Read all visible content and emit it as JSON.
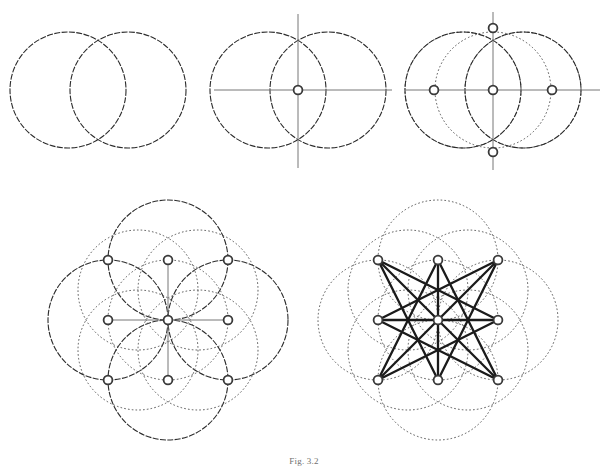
{
  "figure": {
    "caption": "Fig. 3.2",
    "panel_count": 5,
    "colors": {
      "background": "#ffffff",
      "solid_stroke": "#2b2b2b",
      "dotted_stroke": "#555555",
      "axis_stroke": "#777777",
      "node_stroke": "#3a3a3a",
      "node_fill": "#ffffff",
      "star_stroke": "#1a1a1a"
    },
    "stroke_widths": {
      "solid_circle": 1.1,
      "dotted_circle": 1.0,
      "axis": 1.0,
      "node_ring": 1.8,
      "star_chord": 2.3
    },
    "node_radius": 4.4,
    "panels": [
      {
        "id": "panel-1",
        "label": "Step 1 - Vesica piscis",
        "step_number": 1,
        "origin": [
          0,
          0
        ],
        "unit": 58,
        "circles": [
          {
            "cx": 68,
            "cy": 90,
            "r": 58,
            "style": "solid"
          },
          {
            "cx": 128,
            "cy": 90,
            "r": 58,
            "style": "solid"
          }
        ],
        "axes": [],
        "nodes": [],
        "chords": []
      },
      {
        "id": "panel-2",
        "label": "Step 2 - Axes through centre",
        "step_number": 2,
        "origin": [
          195,
          0
        ],
        "unit": 58,
        "circles": [
          {
            "cx": 268,
            "cy": 90,
            "r": 58,
            "style": "solid"
          },
          {
            "cx": 328,
            "cy": 90,
            "r": 58,
            "style": "solid"
          }
        ],
        "axes": [
          {
            "x1": 214,
            "y1": 90,
            "x2": 392,
            "y2": 90
          },
          {
            "x1": 298,
            "y1": 14,
            "x2": 298,
            "y2": 168
          }
        ],
        "nodes": [
          {
            "cx": 298,
            "cy": 90,
            "name": "centre"
          }
        ],
        "chords": []
      },
      {
        "id": "panel-3",
        "label": "Step 3 - Four cardinal points",
        "step_number": 3,
        "origin": [
          395,
          0
        ],
        "unit": 58,
        "circles": [
          {
            "cx": 463,
            "cy": 90,
            "r": 58,
            "style": "dotted"
          },
          {
            "cx": 523,
            "cy": 90,
            "r": 58,
            "style": "dotted"
          },
          {
            "cx": 493,
            "cy": 90,
            "r": 58,
            "style": "dotted"
          },
          {
            "cx": 463,
            "cy": 90,
            "r": 58,
            "style": "solid"
          },
          {
            "cx": 523,
            "cy": 90,
            "r": 58,
            "style": "solid"
          }
        ],
        "axes": [
          {
            "x1": 405,
            "y1": 90,
            "x2": 600,
            "y2": 90
          },
          {
            "x1": 493,
            "y1": 12,
            "x2": 493,
            "y2": 170
          }
        ],
        "nodes": [
          {
            "cx": 493,
            "cy": 90,
            "name": "centre"
          },
          {
            "cx": 434,
            "cy": 90,
            "name": "west"
          },
          {
            "cx": 552,
            "cy": 90,
            "name": "east"
          },
          {
            "cx": 493,
            "cy": 28,
            "name": "north"
          },
          {
            "cx": 493,
            "cy": 152,
            "name": "south"
          }
        ],
        "chords": []
      },
      {
        "id": "panel-4",
        "label": "Step 4 - Nine-point lattice",
        "step_number": 4,
        "origin": [
          40,
          195
        ],
        "unit": 60,
        "centre": [
          168,
          320
        ],
        "circles": [
          {
            "cx": 168,
            "cy": 260,
            "r": 60,
            "style": "solid"
          },
          {
            "cx": 168,
            "cy": 380,
            "r": 60,
            "style": "solid"
          },
          {
            "cx": 108,
            "cy": 320,
            "r": 60,
            "style": "solid"
          },
          {
            "cx": 228,
            "cy": 320,
            "r": 60,
            "style": "solid"
          },
          {
            "cx": 168,
            "cy": 320,
            "r": 60,
            "style": "dotted"
          },
          {
            "cx": 138,
            "cy": 290,
            "r": 60,
            "style": "dotted"
          },
          {
            "cx": 198,
            "cy": 290,
            "r": 60,
            "style": "dotted"
          },
          {
            "cx": 138,
            "cy": 350,
            "r": 60,
            "style": "dotted"
          },
          {
            "cx": 198,
            "cy": 350,
            "r": 60,
            "style": "dotted"
          }
        ],
        "axes": [
          {
            "x1": 108,
            "y1": 320,
            "x2": 228,
            "y2": 320
          },
          {
            "x1": 168,
            "y1": 260,
            "x2": 168,
            "y2": 380
          }
        ],
        "nodes": [
          {
            "cx": 108,
            "cy": 260,
            "name": "north-west"
          },
          {
            "cx": 168,
            "cy": 260,
            "name": "north"
          },
          {
            "cx": 228,
            "cy": 260,
            "name": "north-east"
          },
          {
            "cx": 108,
            "cy": 320,
            "name": "west"
          },
          {
            "cx": 168,
            "cy": 320,
            "name": "centre"
          },
          {
            "cx": 228,
            "cy": 320,
            "name": "east"
          },
          {
            "cx": 108,
            "cy": 380,
            "name": "south-west"
          },
          {
            "cx": 168,
            "cy": 380,
            "name": "south"
          },
          {
            "cx": 228,
            "cy": 380,
            "name": "south-east"
          }
        ],
        "chords": []
      },
      {
        "id": "panel-5",
        "label": "Step 5 - Octagram {8/3}",
        "step_number": 5,
        "origin": [
          290,
          195
        ],
        "unit": 60,
        "centre": [
          438,
          320
        ],
        "star_schlafli": "{8/3}",
        "circles": [
          {
            "cx": 438,
            "cy": 260,
            "r": 60,
            "style": "dotted"
          },
          {
            "cx": 438,
            "cy": 380,
            "r": 60,
            "style": "dotted"
          },
          {
            "cx": 378,
            "cy": 320,
            "r": 60,
            "style": "dotted"
          },
          {
            "cx": 498,
            "cy": 320,
            "r": 60,
            "style": "dotted"
          },
          {
            "cx": 438,
            "cy": 320,
            "r": 60,
            "style": "dotted"
          },
          {
            "cx": 408,
            "cy": 290,
            "r": 60,
            "style": "dotted"
          },
          {
            "cx": 468,
            "cy": 290,
            "r": 60,
            "style": "dotted"
          },
          {
            "cx": 408,
            "cy": 350,
            "r": 60,
            "style": "dotted"
          },
          {
            "cx": 468,
            "cy": 350,
            "r": 60,
            "style": "dotted"
          }
        ],
        "axes": [
          {
            "x1": 378,
            "y1": 320,
            "x2": 498,
            "y2": 320
          },
          {
            "x1": 438,
            "y1": 260,
            "x2": 438,
            "y2": 380
          }
        ],
        "nodes": [
          {
            "cx": 378,
            "cy": 260,
            "name": "north-west"
          },
          {
            "cx": 438,
            "cy": 260,
            "name": "north"
          },
          {
            "cx": 498,
            "cy": 260,
            "name": "north-east"
          },
          {
            "cx": 378,
            "cy": 320,
            "name": "west"
          },
          {
            "cx": 438,
            "cy": 320,
            "name": "centre"
          },
          {
            "cx": 498,
            "cy": 320,
            "name": "east"
          },
          {
            "cx": 378,
            "cy": 380,
            "name": "south-west"
          },
          {
            "cx": 438,
            "cy": 380,
            "name": "south"
          },
          {
            "cx": 498,
            "cy": 380,
            "name": "south-east"
          }
        ],
        "ring_order": [
          "north-west",
          "north",
          "north-east",
          "east",
          "south-east",
          "south",
          "south-west",
          "west"
        ],
        "chords": [
          {
            "from": "north-west",
            "to": "east"
          },
          {
            "from": "north",
            "to": "south-east"
          },
          {
            "from": "north-east",
            "to": "south"
          },
          {
            "from": "east",
            "to": "south-west"
          },
          {
            "from": "south-east",
            "to": "west"
          },
          {
            "from": "south",
            "to": "north-west"
          },
          {
            "from": "south-west",
            "to": "north"
          },
          {
            "from": "west",
            "to": "north-east"
          },
          {
            "from": "north-west",
            "to": "south-east"
          },
          {
            "from": "north-east",
            "to": "south-west"
          },
          {
            "from": "north",
            "to": "south"
          },
          {
            "from": "west",
            "to": "east"
          }
        ]
      }
    ]
  }
}
